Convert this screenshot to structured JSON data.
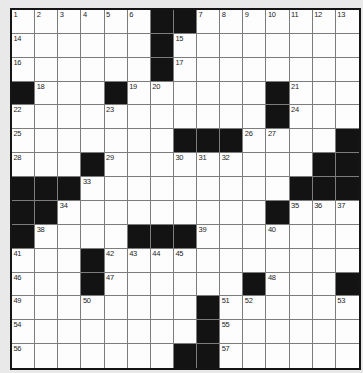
{
  "grid": {
    "rows": 15,
    "cols": 15,
    "first_number": "1",
    "last_number": "57",
    "colors": {
      "page_background": "#e9e9e9",
      "cell_background": "#fdfdfd",
      "black_square": "#131313",
      "grid_line": "#7c7c7c",
      "outer_border": "#151515",
      "number_text": "#1d1d1d"
    },
    "cells": [
      [
        "1",
        "2",
        "3",
        "4",
        "5",
        "6",
        "#",
        "#",
        "7",
        "8",
        "9",
        "10",
        "11",
        "12",
        "13"
      ],
      [
        "14",
        "",
        "",
        "",
        "",
        "",
        "#",
        "15",
        "",
        "",
        "",
        "",
        "",
        "",
        ""
      ],
      [
        "16",
        "",
        "",
        "",
        "",
        "",
        "#",
        "17",
        "",
        "",
        "",
        "",
        "",
        "",
        ""
      ],
      [
        "#",
        "18",
        "",
        "",
        "#",
        "19",
        "20",
        "",
        "",
        "",
        "",
        "#",
        "21",
        "",
        ""
      ],
      [
        "22",
        "",
        "",
        "",
        "23",
        "",
        "",
        "",
        "",
        "",
        "",
        "#",
        "24",
        "",
        ""
      ],
      [
        "25",
        "",
        "",
        "",
        "",
        "",
        "",
        "#",
        "#",
        "#",
        "26",
        "27",
        "",
        "",
        "#"
      ],
      [
        "28",
        "",
        "",
        "#",
        "29",
        "",
        "",
        "30",
        "31",
        "32",
        "",
        "",
        "",
        "#",
        "#"
      ],
      [
        "#",
        "#",
        "#",
        "33",
        "",
        "",
        "",
        "",
        "",
        "",
        "",
        "",
        "#",
        "#",
        "#"
      ],
      [
        "#",
        "#",
        "34",
        "",
        "",
        "",
        "",
        "",
        "",
        "",
        "",
        "#",
        "35",
        "36",
        "37"
      ],
      [
        "#",
        "38",
        "",
        "",
        "",
        "#",
        "#",
        "#",
        "39",
        "",
        "",
        "40",
        "",
        "",
        ""
      ],
      [
        "41",
        "",
        "",
        "#",
        "42",
        "43",
        "44",
        "45",
        "",
        "",
        "",
        "",
        "",
        "",
        ""
      ],
      [
        "46",
        "",
        "",
        "#",
        "47",
        "",
        "",
        "",
        "",
        "",
        "#",
        "48",
        "",
        "",
        "#"
      ],
      [
        "49",
        "",
        "",
        "50",
        "",
        "",
        "",
        "",
        "#",
        "51",
        "52",
        "",
        "",
        "",
        "53"
      ],
      [
        "54",
        "",
        "",
        "",
        "",
        "",
        "",
        "",
        "#",
        "55",
        "",
        "",
        "",
        "",
        ""
      ],
      [
        "56",
        "",
        "",
        "",
        "",
        "",
        "",
        "#",
        "#",
        "57",
        "",
        "",
        "",
        "",
        ""
      ]
    ]
  }
}
